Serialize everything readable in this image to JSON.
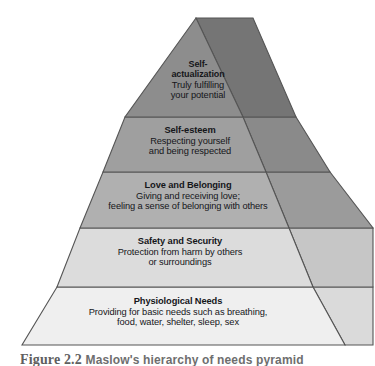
{
  "figure": {
    "caption_number": "Figure 2.2",
    "caption_text": "Maslow's hierarchy of needs pyramid",
    "title": "Maslow's Hierarchy of Needs Pyramid",
    "background_color": "#ffffff",
    "outline_color": "#555555",
    "text_color": "#15161a"
  },
  "chart_data": {
    "type": "pyramid",
    "title": "Maslow's hierarchy of needs pyramid",
    "orientation": "apex-top",
    "levels_count": 5,
    "categories": [
      "Self-actualization",
      "Self-esteem",
      "Love and Belonging",
      "Safety and Security",
      "Physiological Needs"
    ],
    "values": [
      1,
      2,
      3,
      4,
      5
    ],
    "xlabel": "",
    "ylabel": "",
    "legend": "none",
    "grid": false,
    "levels": [
      {
        "rank": 1,
        "rank_from_base": 5,
        "title": "Self-actualization",
        "description": "Truly fulfilling your potential",
        "lines": [
          "Self-",
          "actualization",
          "Truly fulfilling",
          "your potential"
        ],
        "front_color": "#8d8d8d",
        "side_color": "#757575"
      },
      {
        "rank": 2,
        "rank_from_base": 4,
        "title": "Self-esteem",
        "description": "Respecting yourself and being respected",
        "lines": [
          "Self-esteem",
          "Respecting yourself",
          "and being respected"
        ],
        "front_color": "#9f9f9f",
        "side_color": "#8a8a8a"
      },
      {
        "rank": 3,
        "rank_from_base": 3,
        "title": "Love and Belonging",
        "description": "Giving and receiving love; feeling a sense of belonging with others",
        "lines": [
          "Love and Belonging",
          "Giving and receiving love;",
          "feeling a sense of belonging with others"
        ],
        "front_color": "#b0b0b0",
        "side_color": "#9b9b9b"
      },
      {
        "rank": 4,
        "rank_from_base": 2,
        "title": "Safety and Security",
        "description": "Protection from harm by others or surroundings",
        "lines": [
          "Safety and Security",
          "Protection from harm by others",
          "or surroundings"
        ],
        "front_color": "#dcdcdc",
        "side_color": "#c6c6c6"
      },
      {
        "rank": 5,
        "rank_from_base": 1,
        "title": "Physiological Needs",
        "description": "Providing for basic needs such as breathing, food, water, shelter, sleep, sex",
        "lines": [
          "Physiological Needs",
          "Providing for basic needs such as breathing,",
          "food, water, shelter, sleep, sex"
        ],
        "front_color": "#efefef",
        "side_color": "#dadada"
      }
    ]
  }
}
